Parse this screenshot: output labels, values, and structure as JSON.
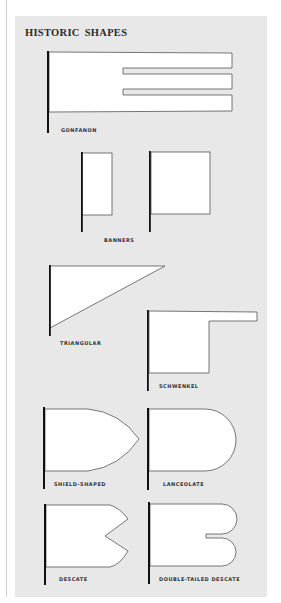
{
  "title": "HISTORIC SHAPES",
  "colors": {
    "panel_background": "#e8e8e8",
    "flag_fill": "#ffffff",
    "flag_outline": "#555555",
    "pole": "#111111",
    "label_text": "#333333",
    "title_text": "#2a2a2a"
  },
  "shapes": [
    {
      "name": "gonfanon",
      "label": "GONFANON"
    },
    {
      "name": "banners",
      "label": "BANNERS",
      "count": 2
    },
    {
      "name": "triangular",
      "label": "TRIANGULAR"
    },
    {
      "name": "schwenkel",
      "label": "SCHWENKEL"
    },
    {
      "name": "shield-shaped",
      "label": "SHIELD-SHAPED"
    },
    {
      "name": "lanceolate",
      "label": "LANCEOLATE"
    },
    {
      "name": "descate",
      "label": "DESCATE"
    },
    {
      "name": "double-tailed-descate",
      "label": "DOUBLE-TAILED DESCATE"
    }
  ]
}
